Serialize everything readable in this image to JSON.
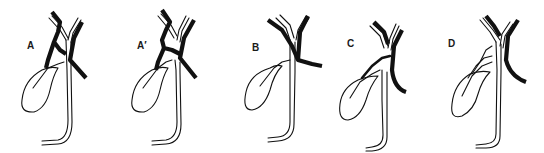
{
  "diagram": {
    "type": "anatomical-variant-series",
    "panels": [
      {
        "id": "A",
        "label": "A"
      },
      {
        "id": "A_prime",
        "label": "A′"
      },
      {
        "id": "B",
        "label": "B"
      },
      {
        "id": "C",
        "label": "C"
      },
      {
        "id": "D",
        "label": "D"
      }
    ]
  }
}
